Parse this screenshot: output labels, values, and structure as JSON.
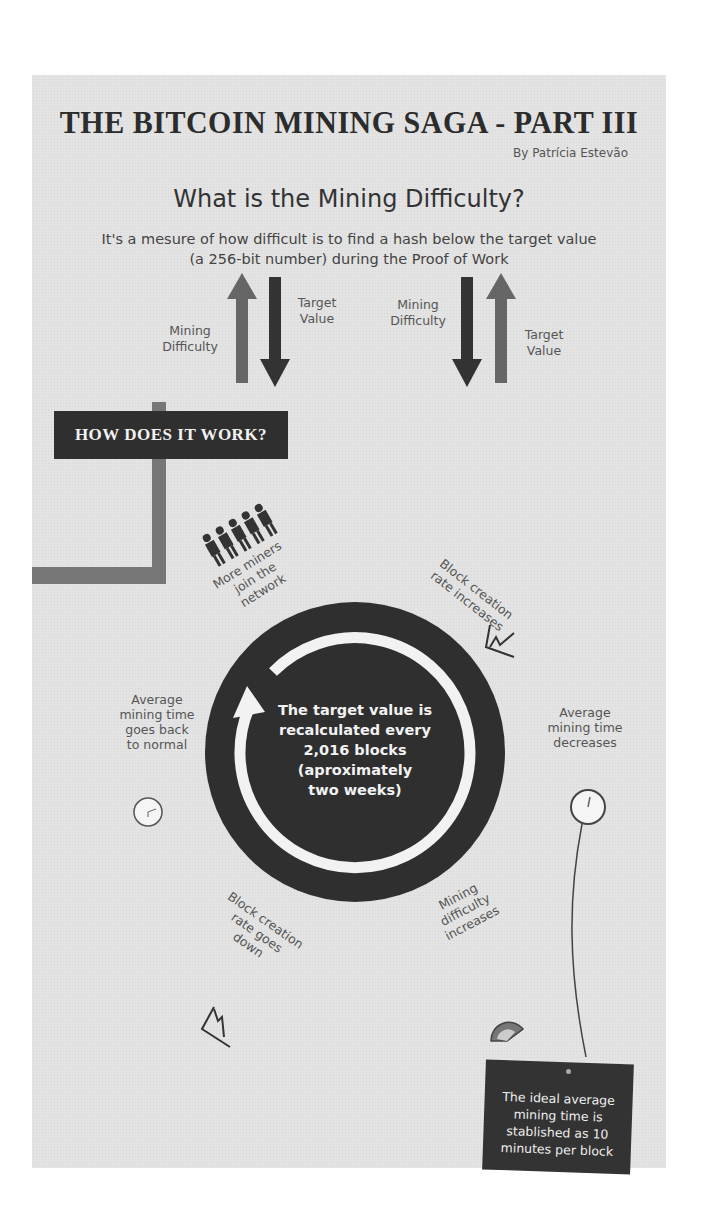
{
  "header": {
    "title": "THE BITCOIN MINING SAGA - PART III",
    "byline": "By Patrícia Estevão"
  },
  "intro": {
    "question": "What is the Mining Difficulty?",
    "description_line1": "It's a mesure of how difficult is to find a hash below the target value",
    "description_line2": "(a 256-bit number) during the Proof of Work"
  },
  "relations": {
    "left": {
      "up_label_line1": "Mining",
      "up_label_line2": "Difficulty",
      "down_label_line1": "Target",
      "down_label_line2": "Value"
    },
    "right": {
      "down_label_line1": "Mining",
      "down_label_line2": "Difficulty",
      "up_label_line1": "Target",
      "up_label_line2": "Value"
    }
  },
  "section": {
    "how_it_works": "HOW DOES IT WORK?"
  },
  "cycle": {
    "center_lines": [
      "The target value is",
      "recalculated every",
      "2,016 blocks",
      "(aproximately",
      "two weeks)"
    ],
    "steps": [
      {
        "icon": "people-icon",
        "lines": [
          "More miners",
          "join the",
          "network"
        ]
      },
      {
        "icon": "rising-chart-icon",
        "lines": [
          "Block creation",
          "rate increases"
        ]
      },
      {
        "icon": "clock-icon",
        "lines": [
          "Average",
          "mining time",
          "decreases"
        ]
      },
      {
        "icon": "gauge-icon",
        "lines": [
          "Mining",
          "difficulty",
          "increases"
        ]
      },
      {
        "icon": "falling-chart-icon",
        "lines": [
          "Block creation",
          "rate goes",
          "down"
        ]
      },
      {
        "icon": "clock-icon",
        "lines": [
          "Average",
          "mining time",
          "goes back",
          "to normal"
        ]
      }
    ]
  },
  "note": {
    "lines": [
      "The ideal average",
      "mining time is",
      "stablished as 10",
      "minutes per block"
    ]
  },
  "colors": {
    "background": "#e3e3e3",
    "dark": "#2f2f2f",
    "mid_gray": "#777777",
    "text": "#444444"
  }
}
